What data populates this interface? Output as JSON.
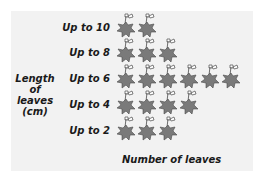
{
  "chart_data": {
    "type": "pictograph",
    "title": "",
    "ylabel": "Length of leaves (cm)",
    "xlabel": "Number of leaves",
    "categories": [
      "Up to 10",
      "Up to 8",
      "Up to 6",
      "Up to 4",
      "Up to 2"
    ],
    "values": [
      2,
      3,
      6,
      4,
      3
    ],
    "icon": "leaf-icon",
    "grid": false,
    "legend": null
  },
  "labels": {
    "ylabel_lines": [
      "Length",
      "of",
      "leaves",
      "(cm)"
    ],
    "xlabel": "Number of leaves"
  },
  "rows": [
    {
      "label": "Up to 10",
      "count": 2
    },
    {
      "label": "Up to 8",
      "count": 3
    },
    {
      "label": "Up to 6",
      "count": 6
    },
    {
      "label": "Up to 4",
      "count": 4
    },
    {
      "label": "Up to 2",
      "count": 3
    }
  ],
  "colors": {
    "background": "#f2f2f2",
    "leaf_fill": "#7a7a7a",
    "leaf_outline": "#4a4a4a",
    "text": "#1a1a1a"
  }
}
